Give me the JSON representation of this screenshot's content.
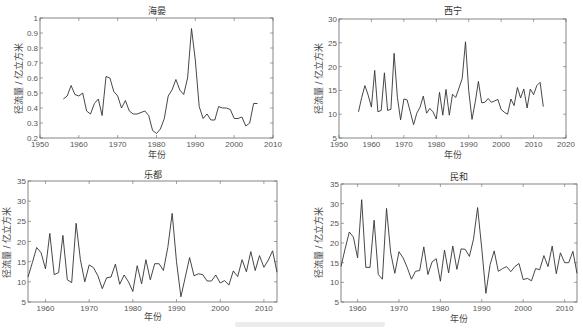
{
  "figure": {
    "caption": ""
  },
  "chart_data": [
    {
      "type": "line",
      "title": "海晏",
      "xlabel": "年份",
      "ylabel": "径流量 / 亿立方米",
      "xlim": [
        1950,
        2010
      ],
      "ylim": [
        0.2,
        1.0
      ],
      "xticks": [
        1950,
        1960,
        1970,
        1980,
        1990,
        2000,
        2010
      ],
      "yticks": [
        0.2,
        0.3,
        0.4,
        0.5,
        0.6,
        0.7,
        0.8,
        0.9,
        1
      ],
      "ytick_labels": [
        "0.2",
        "0.3",
        "0.4",
        "0.5",
        "0.6",
        "0.7",
        "0.8",
        "0.9",
        "1"
      ],
      "grid": false,
      "x": [
        1956,
        1957,
        1958,
        1959,
        1960,
        1961,
        1962,
        1963,
        1964,
        1965,
        1966,
        1967,
        1968,
        1969,
        1970,
        1971,
        1972,
        1973,
        1974,
        1975,
        1976,
        1977,
        1978,
        1979,
        1980,
        1981,
        1982,
        1983,
        1984,
        1985,
        1986,
        1987,
        1988,
        1989,
        1990,
        1991,
        1992,
        1993,
        1994,
        1995,
        1996,
        1997,
        1998,
        1999,
        2000,
        2001,
        2002,
        2003,
        2004,
        2005,
        2006
      ],
      "values": [
        0.46,
        0.48,
        0.55,
        0.49,
        0.48,
        0.5,
        0.38,
        0.36,
        0.43,
        0.46,
        0.35,
        0.61,
        0.6,
        0.51,
        0.48,
        0.4,
        0.45,
        0.38,
        0.36,
        0.36,
        0.37,
        0.38,
        0.35,
        0.25,
        0.23,
        0.26,
        0.33,
        0.48,
        0.52,
        0.59,
        0.52,
        0.49,
        0.6,
        0.93,
        0.72,
        0.41,
        0.33,
        0.36,
        0.32,
        0.32,
        0.41,
        0.4,
        0.4,
        0.39,
        0.33,
        0.33,
        0.34,
        0.28,
        0.3,
        0.43,
        0.43
      ]
    },
    {
      "type": "line",
      "title": "西宁",
      "xlabel": "年份",
      "ylabel": "径流量 / 亿立方米",
      "xlim": [
        1950,
        2020
      ],
      "ylim": [
        5,
        30
      ],
      "xticks": [
        1950,
        1960,
        1970,
        1980,
        1990,
        2000,
        2010,
        2020
      ],
      "yticks": [
        5,
        10,
        15,
        20,
        25,
        30
      ],
      "ytick_labels": [
        "5",
        "10",
        "15",
        "20",
        "25",
        "30"
      ],
      "grid": false,
      "x": [
        1956,
        1957,
        1958,
        1959,
        1960,
        1961,
        1962,
        1963,
        1964,
        1965,
        1966,
        1967,
        1968,
        1969,
        1970,
        1971,
        1972,
        1973,
        1974,
        1975,
        1976,
        1977,
        1978,
        1979,
        1980,
        1981,
        1982,
        1983,
        1984,
        1985,
        1986,
        1987,
        1988,
        1989,
        1990,
        1991,
        1992,
        1993,
        1994,
        1995,
        1996,
        1997,
        1998,
        1999,
        2000,
        2001,
        2002,
        2003,
        2004,
        2005,
        2006,
        2007,
        2008,
        2009,
        2010,
        2011,
        2012,
        2013
      ],
      "values": [
        10.5,
        13.5,
        16,
        14,
        11.5,
        19.2,
        10.5,
        10.8,
        18.7,
        10.8,
        11,
        22.8,
        13.5,
        8.8,
        13.2,
        13,
        10.5,
        7.8,
        10.2,
        11.5,
        13.8,
        10.2,
        11.2,
        10.5,
        9,
        14.6,
        9.8,
        15.2,
        9.8,
        14.2,
        13.5,
        15.5,
        17.5,
        25.2,
        15,
        8.9,
        12.5,
        16.9,
        12.4,
        12.5,
        13.3,
        12.5,
        12.8,
        13.1,
        11,
        10.4,
        10,
        13.2,
        11.8,
        15.6,
        13.4,
        15.3,
        11.3,
        15.3,
        14.1,
        16,
        16.7,
        11.6
      ]
    },
    {
      "type": "line",
      "title": "乐都",
      "xlabel": "年份",
      "ylabel": "径流量 / 亿立方米",
      "xlim": [
        1956,
        2013
      ],
      "ylim": [
        5,
        35
      ],
      "xticks": [
        1960,
        1970,
        1980,
        1990,
        2000,
        2010
      ],
      "yticks": [
        5,
        10,
        15,
        20,
        25,
        30,
        35
      ],
      "ytick_labels": [
        "5",
        "10",
        "15",
        "20",
        "25",
        "30",
        "35"
      ],
      "grid": false,
      "x": [
        1956,
        1957,
        1958,
        1959,
        1960,
        1961,
        1962,
        1963,
        1964,
        1965,
        1966,
        1967,
        1968,
        1969,
        1970,
        1971,
        1972,
        1973,
        1974,
        1975,
        1976,
        1977,
        1978,
        1979,
        1980,
        1981,
        1982,
        1983,
        1984,
        1985,
        1986,
        1987,
        1988,
        1989,
        1990,
        1991,
        1992,
        1993,
        1994,
        1995,
        1996,
        1997,
        1998,
        1999,
        2000,
        2001,
        2002,
        2003,
        2004,
        2005,
        2006,
        2007,
        2008,
        2009,
        2010,
        2011,
        2012,
        2013
      ],
      "values": [
        11.2,
        14.8,
        18.5,
        17.2,
        13.2,
        22,
        11.8,
        12.3,
        21.5,
        10.5,
        9.8,
        24.5,
        15.5,
        10,
        14.2,
        13.5,
        11.5,
        8.3,
        11,
        11.2,
        14.4,
        9.4,
        11.7,
        10,
        7.6,
        14,
        9.5,
        15.5,
        10.5,
        14.5,
        14.5,
        12.8,
        18.5,
        27,
        15,
        6.3,
        11.2,
        16,
        11.5,
        12,
        11.8,
        10.2,
        10.2,
        11.7,
        9.7,
        10.3,
        9.2,
        12.7,
        11.3,
        15.5,
        12.5,
        17.5,
        12.8,
        16.5,
        13.6,
        15.4,
        17.7,
        12.4
      ]
    },
    {
      "type": "line",
      "title": "民和",
      "xlabel": "年份",
      "ylabel": "径流量 / 亿立方米",
      "xlim": [
        1956,
        2013
      ],
      "ylim": [
        5,
        35
      ],
      "xticks": [
        1960,
        1970,
        1980,
        1990,
        2000,
        2010
      ],
      "yticks": [
        5,
        10,
        15,
        20,
        25,
        30,
        35
      ],
      "ytick_labels": [
        "5",
        "10",
        "15",
        "20",
        "25",
        "30",
        "35"
      ],
      "grid": false,
      "x": [
        1956,
        1957,
        1958,
        1959,
        1960,
        1961,
        1962,
        1963,
        1964,
        1965,
        1966,
        1967,
        1968,
        1969,
        1970,
        1971,
        1972,
        1973,
        1974,
        1975,
        1976,
        1977,
        1978,
        1979,
        1980,
        1981,
        1982,
        1983,
        1984,
        1985,
        1986,
        1987,
        1988,
        1989,
        1990,
        1991,
        1992,
        1993,
        1994,
        1995,
        1996,
        1997,
        1998,
        1999,
        2000,
        2001,
        2002,
        2003,
        2004,
        2005,
        2006,
        2007,
        2008,
        2009,
        2010,
        2011,
        2012,
        2013
      ],
      "values": [
        14,
        18.5,
        22.8,
        21.5,
        16.2,
        31,
        13.8,
        13.8,
        25.8,
        12,
        10.8,
        28.8,
        17.5,
        12.3,
        17.8,
        16.2,
        13.8,
        10.8,
        12.8,
        13,
        19,
        12,
        15.2,
        16,
        10.3,
        18.2,
        12.4,
        19.2,
        13.3,
        18.5,
        18.4,
        16.6,
        21,
        29,
        18.5,
        7.2,
        14.5,
        18,
        12.8,
        13.5,
        14,
        12.7,
        14,
        14.8,
        10.7,
        11,
        10.4,
        13.5,
        13.2,
        16.8,
        14,
        19.2,
        12.2,
        17.5,
        15,
        15,
        17.9,
        12.3
      ]
    }
  ]
}
